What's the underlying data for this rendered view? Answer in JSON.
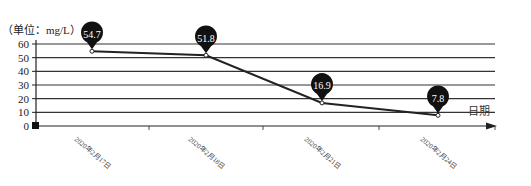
{
  "chart_data": {
    "type": "line",
    "title": "",
    "unit_label": "（单位：mg/L）",
    "xlabel": "日期",
    "ylabel": "（单位：mg/L）",
    "ylim": [
      0,
      60
    ],
    "yticks": [
      0,
      10,
      20,
      30,
      40,
      50,
      60
    ],
    "grid": true,
    "categories": [
      "2020年2月17日",
      "2020年2月18日",
      "2020年2月21日",
      "2020年2月24日"
    ],
    "series": [
      {
        "name": "浓度",
        "values": [
          54.7,
          51.8,
          16.9,
          7.8
        ]
      }
    ],
    "data_labels": [
      "54.7",
      "51.8",
      "16.9",
      "7.8"
    ],
    "colors": {
      "line": "#222222",
      "grid": "#333333",
      "pin": "#111111",
      "pin_text": "#ffffff"
    }
  }
}
